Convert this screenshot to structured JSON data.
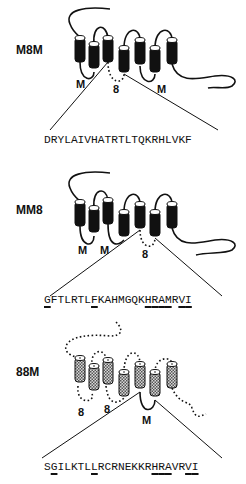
{
  "panels": [
    {
      "id": "M8M",
      "label": "M8M",
      "helices_style": "solid",
      "loop_labels": [
        "M",
        "8",
        "M"
      ],
      "sequence": "DRYLAIVHATRTLTQKRHLVKF",
      "underlined_positions": []
    },
    {
      "id": "MM8",
      "label": "MM8",
      "helices_style": "solid",
      "loop_labels": [
        "M",
        "M",
        "8"
      ],
      "sequence": "GFTLRTLFKAHMGQKHRAMRVI",
      "underlined_positions": [
        0,
        7,
        15,
        16,
        17,
        18,
        20,
        21
      ]
    },
    {
      "id": "88M",
      "label": "88M",
      "helices_style": "stippled",
      "loop_labels": [
        "8",
        "8",
        "M"
      ],
      "sequence": "SGILKTLLRCRNEKKRHRAVRVI",
      "underlined_positions": [
        1,
        7,
        16,
        17,
        18,
        21,
        22
      ]
    }
  ],
  "colors": {
    "ink": "#111111",
    "stipple": "#9a9a9a",
    "background": "#ffffff"
  }
}
